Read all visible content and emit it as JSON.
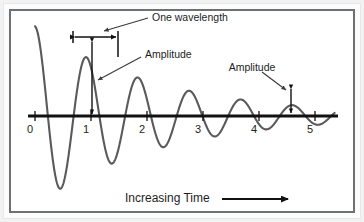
{
  "figure": {
    "background_color": "#ffffff",
    "frame_color": "#6e7174",
    "wave_color": "#5a5a5a",
    "axis_color": "#111111",
    "text_color": "#1d1d1d"
  },
  "axis": {
    "tick_labels": [
      "0",
      "1",
      "2",
      "3",
      "4",
      "5"
    ],
    "tick_values": [
      0,
      1,
      2,
      3,
      4,
      5
    ],
    "baseline_y": 116
  },
  "annotations": {
    "wavelength_label": "One wavelength",
    "amplitude_label_left": "Amplitude",
    "amplitude_label_right": "Amplitude",
    "caption": "Increasing Time"
  },
  "chart_data": {
    "type": "line",
    "title": "",
    "subtitle": "",
    "xlabel": "Increasing Time",
    "ylabel": "",
    "xlim": [
      0,
      5.35
    ],
    "ylim": [
      -1.25,
      1.25
    ],
    "grid": false,
    "legend": null,
    "series": [
      {
        "name": "damped oscillation",
        "description": "y = A0 * exp(-k*t) * cos(2*pi*t/wavelength), starting near positive peak at t=0 and decaying toward t=5",
        "amplitude_initial": 1.18,
        "decay_constant": 0.46,
        "wavelength": 0.92,
        "phase_deg": 0,
        "x": [
          0.0,
          0.1,
          0.2,
          0.3,
          0.4,
          0.5,
          0.6,
          0.7,
          0.8,
          0.9,
          1.0,
          1.1,
          1.2,
          1.3,
          1.4,
          1.5,
          1.6,
          1.7,
          1.8,
          1.9,
          2.0,
          2.1,
          2.2,
          2.3,
          2.4,
          2.5,
          2.6,
          2.7,
          2.8,
          2.9,
          3.0,
          3.1,
          3.2,
          3.3,
          3.4,
          3.5,
          3.6,
          3.7,
          3.8,
          3.9,
          4.0,
          4.1,
          4.2,
          4.3,
          4.4,
          4.5,
          4.6,
          4.7,
          4.8,
          4.9,
          5.0,
          5.1,
          5.2,
          5.3
        ],
        "y": [
          1.18,
          0.82,
          -0.02,
          -0.82,
          -1.18,
          -0.83,
          -0.05,
          0.72,
          1.02,
          0.72,
          0.03,
          -0.62,
          -0.89,
          -0.65,
          -0.02,
          0.56,
          0.8,
          0.57,
          0.01,
          -0.5,
          -0.7,
          -0.5,
          -0.01,
          0.44,
          0.62,
          0.45,
          0.01,
          -0.39,
          -0.55,
          -0.4,
          -0.01,
          0.34,
          0.48,
          0.35,
          0.01,
          -0.3,
          -0.42,
          -0.31,
          -0.01,
          0.26,
          0.37,
          0.27,
          0.01,
          -0.23,
          -0.32,
          -0.24,
          -0.01,
          0.2,
          0.28,
          0.21,
          0.01,
          -0.17,
          -0.24,
          -0.18
        ]
      }
    ],
    "annotations": [
      {
        "kind": "span-arrow",
        "label": "One wavelength",
        "from_x": 0.68,
        "to_x": 1.48,
        "note": "horizontal double-headed arrow marking one full period"
      },
      {
        "kind": "vertical-arrow",
        "label": "Amplitude",
        "at_x": 1.0,
        "from_y": 0.0,
        "to_y": 1.02,
        "note": "full amplitude near start of wave"
      },
      {
        "kind": "vertical-arrow",
        "label": "Amplitude",
        "at_x": 4.2,
        "from_y": 0.0,
        "to_y": 0.37,
        "note": "reduced amplitude later in the wave"
      },
      {
        "kind": "caption-arrow",
        "label": "Increasing Time",
        "direction": "right"
      }
    ]
  }
}
